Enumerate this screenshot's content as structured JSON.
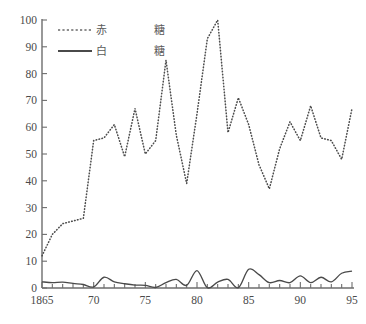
{
  "chart_data": {
    "type": "line",
    "title": "",
    "subtitle": "",
    "xlabel": "",
    "ylabel": "",
    "xlim": [
      1865,
      1895
    ],
    "ylim": [
      0,
      100
    ],
    "grid": false,
    "legend_position": "top-left",
    "x": [
      1865,
      1866,
      1867,
      1868,
      1869,
      1870,
      1871,
      1872,
      1873,
      1874,
      1875,
      1876,
      1877,
      1878,
      1879,
      1880,
      1881,
      1882,
      1883,
      1884,
      1885,
      1886,
      1887,
      1888,
      1889,
      1890,
      1891,
      1892,
      1893,
      1894,
      1895
    ],
    "xtick_labels": [
      "1865",
      "70",
      "75",
      "80",
      "85",
      "90",
      "95"
    ],
    "xtick_values": [
      1865,
      1870,
      1875,
      1880,
      1885,
      1890,
      1895
    ],
    "ytick_labels": [
      "0",
      "10",
      "20",
      "30",
      "40",
      "50",
      "60",
      "70",
      "80",
      "90",
      "100"
    ],
    "ytick_values": [
      0,
      10,
      20,
      30,
      40,
      50,
      60,
      70,
      80,
      90,
      100
    ],
    "series": [
      {
        "name": "赤糖",
        "legend_label_color": "赤",
        "legend_label_sugar": "糖",
        "style": "dotted",
        "color": "#4d4d4d",
        "values": [
          12,
          20,
          24,
          25,
          26,
          55,
          56,
          61,
          49,
          67,
          50,
          55,
          85,
          57,
          39,
          65,
          93,
          100,
          58,
          71,
          61,
          46,
          37,
          52,
          62,
          55,
          68,
          56,
          55,
          48,
          67
        ]
      },
      {
        "name": "白糖",
        "legend_label_color": "白",
        "legend_label_sugar": "糖",
        "style": "solid",
        "color": "#4a4a4a",
        "values": [
          2.3,
          2.0,
          2.2,
          1.7,
          1.3,
          0.4,
          4.0,
          2.3,
          1.6,
          1.1,
          1.0,
          0.2,
          2.0,
          3.2,
          1.0,
          6.5,
          0.1,
          2.2,
          3.2,
          0.1,
          7.0,
          5.0,
          2.0,
          2.8,
          2.0,
          4.5,
          2.0,
          4.0,
          2.3,
          5.5,
          6.3
        ]
      }
    ],
    "annotations": []
  },
  "legend": {
    "entries": [
      {
        "marker": "dashed-line-swatch",
        "color_char": "赤",
        "sugar_char": "糖"
      },
      {
        "marker": "solid-line-swatch",
        "color_char": "白",
        "sugar_char": "糖"
      }
    ]
  },
  "caption": {
    "text": "         "
  },
  "colors": {
    "axis": "#6d6d6d",
    "tick_text": "#4a4a4a",
    "dotted_series": "#4d4d4d",
    "solid_series": "#4a4a4a",
    "background": "#ffffff"
  }
}
